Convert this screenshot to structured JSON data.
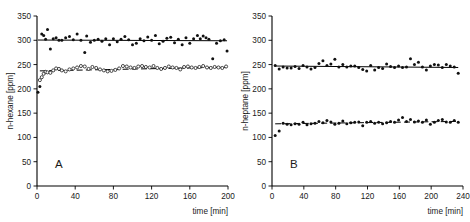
{
  "figure": {
    "panel_a_letter": "A",
    "panel_b_letter": "B",
    "x_axis_title": "time  [min]",
    "panel_a_y_title": "n-hexane  [ppm]",
    "panel_b_y_title": "n-heptane  [ppm]",
    "ink_color": "#101010",
    "background_color": "#ffffff"
  },
  "chart_data": [
    {
      "type": "scatter",
      "panel": "A",
      "title": "",
      "xlabel": "time  [min]",
      "ylabel": "n-hexane  [ppm]",
      "xlim": [
        0,
        200
      ],
      "ylim": [
        0,
        350
      ],
      "xticks": [
        0,
        40,
        80,
        120,
        160,
        200
      ],
      "yticks": [
        0,
        50,
        100,
        150,
        200,
        250,
        300,
        350
      ],
      "xtick_labels": [
        "0",
        "40",
        "80",
        "120",
        "160",
        "200"
      ],
      "ytick_labels": [
        "0",
        "50",
        "100",
        "150",
        "200",
        "250",
        "300",
        "350"
      ],
      "grid": false,
      "legend": "none",
      "series": [
        {
          "name": "n-hexane upper",
          "marker": "filled-circle",
          "trend": "solid",
          "trend_y": [
            300.5,
            299.0
          ],
          "x": [
            1,
            3,
            5,
            7,
            9,
            11,
            14,
            17,
            20,
            23,
            26,
            30,
            34,
            38,
            42,
            46,
            50,
            52,
            56,
            60,
            64,
            68,
            72,
            76,
            80,
            84,
            88,
            92,
            96,
            100,
            104,
            108,
            112,
            116,
            120,
            124,
            128,
            132,
            136,
            140,
            144,
            148,
            152,
            156,
            160,
            164,
            168,
            171,
            174,
            177,
            180,
            184,
            188,
            192,
            196,
            199
          ],
          "y": [
            193,
            205,
            313,
            310,
            302,
            322,
            282,
            303,
            305,
            300,
            300,
            305,
            308,
            301,
            313,
            300,
            275,
            309,
            296,
            300,
            302,
            298,
            303,
            291,
            303,
            297,
            302,
            308,
            301,
            291,
            294,
            303,
            299,
            307,
            300,
            310,
            293,
            298,
            304,
            306,
            295,
            302,
            291,
            305,
            294,
            303,
            310,
            303,
            309,
            305,
            302,
            262,
            294,
            299,
            301,
            278
          ]
        },
        {
          "name": "n-hexane lower",
          "marker": "open-circle",
          "trend": "dashed",
          "trend_y": [
            237.0,
            244.5
          ],
          "x": [
            3,
            5,
            7,
            9,
            11,
            14,
            17,
            20,
            23,
            26,
            30,
            34,
            38,
            42,
            46,
            50,
            54,
            58,
            62,
            66,
            70,
            74,
            78,
            82,
            86,
            90,
            94,
            98,
            102,
            106,
            110,
            114,
            118,
            122,
            126,
            130,
            134,
            138,
            142,
            146,
            150,
            154,
            158,
            162,
            166,
            170,
            174,
            178,
            182,
            186,
            190,
            194,
            198
          ],
          "y": [
            218,
            224,
            231,
            235,
            234,
            233,
            238,
            242,
            241,
            238,
            236,
            240,
            242,
            244,
            247,
            246,
            241,
            245,
            243,
            240,
            238,
            236,
            237,
            239,
            242,
            247,
            246,
            244,
            243,
            246,
            247,
            245,
            244,
            247,
            243,
            241,
            243,
            246,
            244,
            243,
            240,
            245,
            246,
            244,
            243,
            245,
            247,
            244,
            243,
            245,
            244,
            243,
            246
          ]
        }
      ]
    },
    {
      "type": "scatter",
      "panel": "B",
      "title": "",
      "xlabel": "time  [min]",
      "ylabel": "n-heptane  [ppm]",
      "xlim": [
        0,
        240
      ],
      "ylim": [
        0,
        350
      ],
      "xticks": [
        0,
        40,
        80,
        120,
        160,
        200,
        240
      ],
      "yticks": [
        0,
        50,
        100,
        150,
        200,
        250,
        300,
        350
      ],
      "xtick_labels": [
        "0",
        "40",
        "80",
        "120",
        "160",
        "200",
        "240"
      ],
      "ytick_labels": [
        "0",
        "50",
        "100",
        "150",
        "200",
        "250",
        "300",
        "350"
      ],
      "grid": false,
      "legend": "none",
      "series": [
        {
          "name": "n-heptane upper",
          "marker": "filled-circle",
          "trend": "solid",
          "trend_y": [
            247.0,
            244.0
          ],
          "x": [
            4,
            9,
            14,
            19,
            24,
            29,
            34,
            39,
            44,
            49,
            54,
            59,
            64,
            69,
            74,
            79,
            84,
            89,
            94,
            99,
            104,
            109,
            114,
            119,
            124,
            129,
            134,
            139,
            144,
            149,
            154,
            159,
            164,
            169,
            174,
            179,
            184,
            189,
            194,
            199,
            204,
            209,
            214,
            219,
            224,
            229,
            234
          ],
          "y": [
            248,
            241,
            245,
            243,
            243,
            246,
            242,
            248,
            245,
            241,
            244,
            252,
            258,
            248,
            251,
            261,
            245,
            250,
            245,
            247,
            247,
            244,
            240,
            237,
            248,
            239,
            244,
            242,
            251,
            246,
            244,
            247,
            244,
            245,
            262,
            250,
            255,
            245,
            239,
            247,
            250,
            249,
            244,
            250,
            247,
            245,
            232
          ]
        },
        {
          "name": "n-heptane lower",
          "marker": "filled-circle",
          "trend": "dashed",
          "trend_y": [
            128.0,
            133.0
          ],
          "x": [
            4,
            9,
            14,
            19,
            24,
            29,
            34,
            39,
            44,
            49,
            54,
            59,
            64,
            69,
            74,
            79,
            84,
            89,
            94,
            99,
            104,
            109,
            114,
            119,
            124,
            129,
            134,
            139,
            144,
            149,
            154,
            159,
            164,
            169,
            174,
            179,
            184,
            189,
            194,
            199,
            204,
            209,
            214,
            219,
            224,
            229,
            234
          ],
          "y": [
            104,
            113,
            129,
            127,
            126,
            128,
            127,
            131,
            126,
            128,
            129,
            133,
            130,
            135,
            132,
            127,
            129,
            134,
            128,
            130,
            131,
            132,
            124,
            131,
            133,
            129,
            131,
            128,
            130,
            133,
            131,
            136,
            141,
            133,
            137,
            132,
            134,
            131,
            136,
            127,
            131,
            135,
            137,
            132,
            131,
            135,
            131
          ]
        }
      ]
    }
  ]
}
